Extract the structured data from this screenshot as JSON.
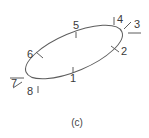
{
  "figure": {
    "caption": "(c)",
    "shape": {
      "type": "ellipse",
      "name": "rotated-ellipse",
      "center_x": 74,
      "center_y": 52,
      "radius_x": 52,
      "radius_y": 19,
      "rotation_deg": -23,
      "stroke_color": "#5d5d5d",
      "stroke_width": 1,
      "fill": "none"
    },
    "labels": [
      {
        "id": "1",
        "text": "1",
        "x": 73,
        "y": 79,
        "tick": {
          "x1": 73,
          "y1": 73,
          "x2": 73,
          "y2": 67
        }
      },
      {
        "id": "2",
        "text": "2",
        "x": 124,
        "y": 52,
        "tick": {
          "x1": 119,
          "y1": 52,
          "x2": 111,
          "y2": 46
        }
      },
      {
        "id": "3",
        "text": "3",
        "x": 137,
        "y": 25,
        "tick": {
          "x1": 131,
          "y1": 22,
          "x2": 124,
          "y2": 29
        }
      },
      {
        "id": "4",
        "text": "4",
        "x": 120,
        "y": 20,
        "tick": {
          "x1": 114,
          "y1": 17,
          "x2": 114,
          "y2": 25
        }
      },
      {
        "id": "5",
        "text": "5",
        "x": 76,
        "y": 26,
        "tick": {
          "x1": 76,
          "y1": 32,
          "x2": 76,
          "y2": 38
        }
      },
      {
        "id": "6",
        "text": "6",
        "x": 30,
        "y": 55,
        "tick": {
          "x1": 36,
          "y1": 52,
          "x2": 43,
          "y2": 58
        }
      },
      {
        "id": "7",
        "text": "7",
        "x": 14,
        "y": 84,
        "tick": {
          "x1": 10,
          "y1": 78,
          "x2": 24,
          "y2": 78
        }
      },
      {
        "id": "8",
        "text": "8",
        "x": 30,
        "y": 92,
        "tick": {
          "x1": 38,
          "y1": 86,
          "x2": 38,
          "y2": 93
        }
      }
    ],
    "caption_position": {
      "x": 77,
      "y": 123
    },
    "background_color": "#ffffff",
    "text_color": "#3a3a3a"
  }
}
